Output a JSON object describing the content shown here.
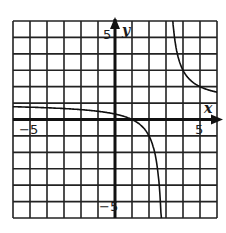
{
  "chart_data": {
    "type": "line",
    "title": "",
    "xlabel": "x",
    "ylabel": "y",
    "xlim": [
      -6,
      6
    ],
    "ylim": [
      -6,
      6
    ],
    "grid": true,
    "grid_step": 1,
    "tick_labels": {
      "x": [
        {
          "value": -5,
          "label": "−5"
        },
        {
          "value": 5,
          "label": "5"
        }
      ],
      "y": [
        {
          "value": 5,
          "label": "5"
        },
        {
          "value": -5,
          "label": "−5"
        }
      ]
    },
    "series": [
      {
        "name": "f(x) = (x − 1)/(x − 3)",
        "function": "(x-1)/(x-3)",
        "vertical_asymptote": 3,
        "horizontal_asymptote": 1,
        "x_intercept": 1,
        "y_intercept": 0.333,
        "x": [
          -6,
          -5,
          -4,
          -3,
          -2,
          -1,
          0,
          1,
          2,
          2.5,
          2.75,
          3.25,
          3.5,
          4,
          5,
          6
        ],
        "values": [
          0.78,
          0.75,
          0.71,
          0.67,
          0.6,
          0.5,
          0.33,
          0,
          -1,
          -3,
          -7,
          9,
          5,
          3,
          2,
          1.67
        ]
      }
    ],
    "legend": null
  },
  "labels": {
    "x_axis": "x",
    "y_axis": "y",
    "x_neg": "−5",
    "x_pos": "5",
    "y_pos": "5",
    "y_neg": "−5"
  }
}
